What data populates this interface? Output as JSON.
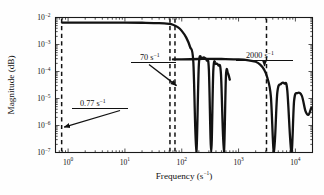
{
  "chart_data": {
    "type": "line",
    "title": "",
    "xlabel": "Frequency (s−1)",
    "xlabel_text": "Frequency (s",
    "xlabel_sup": "−1",
    "xlabel_tail": ")",
    "ylabel": "Magnitude (dB)",
    "xscale": "log",
    "yscale": "log",
    "xlim": [
      0.6,
      20000
    ],
    "ylim": [
      1e-07,
      0.01
    ],
    "grid": false,
    "legend": "none",
    "xticks": [
      {
        "value": 1,
        "label": "10",
        "sup": "0"
      },
      {
        "value": 10,
        "label": "10",
        "sup": "1"
      },
      {
        "value": 100,
        "label": "10",
        "sup": "2"
      },
      {
        "value": 1000,
        "label": "10",
        "sup": "3"
      },
      {
        "value": 10000,
        "label": "10",
        "sup": "4"
      }
    ],
    "yticks": [
      {
        "value": 0.01,
        "label": "10",
        "sup": "−2"
      },
      {
        "value": 0.001,
        "label": "10",
        "sup": "−3"
      },
      {
        "value": 0.0001,
        "label": "10",
        "sup": "−4"
      },
      {
        "value": 1e-05,
        "label": "10",
        "sup": "−5"
      },
      {
        "value": 1e-06,
        "label": "10",
        "sup": "−6"
      },
      {
        "value": 1e-07,
        "label": "10",
        "sup": "−7"
      }
    ],
    "series": [
      {
        "name": "low-frequency-branch",
        "style": "solid",
        "plateau": 0.0065,
        "corner": 70,
        "nulls": [
          180,
          330,
          550
        ],
        "points": [
          [
            0.78,
            0.0065
          ],
          [
            1.0,
            0.0065
          ],
          [
            2.0,
            0.0065
          ],
          [
            5.0,
            0.0065
          ],
          [
            10,
            0.0065
          ],
          [
            20,
            0.0064
          ],
          [
            40,
            0.0062
          ],
          [
            60,
            0.0058
          ],
          [
            70,
            0.0054
          ],
          [
            85,
            0.0044
          ],
          [
            100,
            0.0032
          ],
          [
            120,
            0.0018
          ],
          [
            140,
            0.00082
          ],
          [
            160,
            0.00022
          ],
          [
            180,
            1e-07
          ],
          [
            200,
            0.00018
          ],
          [
            225,
            0.0003
          ],
          [
            250,
            0.00033
          ],
          [
            275,
            0.00026
          ],
          [
            300,
            0.00012
          ],
          [
            330,
            1e-07
          ],
          [
            360,
            0.00012
          ],
          [
            400,
            0.00019
          ],
          [
            440,
            0.00017
          ],
          [
            490,
            8e-05
          ],
          [
            550,
            1e-07
          ],
          [
            600,
            7e-05
          ],
          [
            650,
            8.5e-05
          ],
          [
            700,
            5e-05
          ]
        ]
      },
      {
        "name": "high-frequency-branch",
        "style": "solid",
        "plateau": 0.00028,
        "corner": 2000,
        "nulls": [
          4200,
          8500
        ],
        "points": [
          [
            70,
            0.00028
          ],
          [
            100,
            0.00028
          ],
          [
            200,
            0.00029
          ],
          [
            300,
            0.000295
          ],
          [
            500,
            0.00029
          ],
          [
            1000,
            0.00028
          ],
          [
            1500,
            0.00026
          ],
          [
            2000,
            0.00023
          ],
          [
            2400,
            0.00018
          ],
          [
            2800,
            0.00012
          ],
          [
            3200,
            6e-05
          ],
          [
            3700,
            1.2e-05
          ],
          [
            4200,
            1e-07
          ],
          [
            4800,
            1.6e-05
          ],
          [
            5600,
            3.5e-05
          ],
          [
            6400,
            3.6e-05
          ],
          [
            7200,
            2e-05
          ],
          [
            8500,
            1e-07
          ],
          [
            9500,
            8.5e-06
          ],
          [
            11000,
            1.6e-05
          ],
          [
            13000,
            1.25e-05
          ],
          [
            15000,
            3.5e-06
          ],
          [
            17000,
            2.5e-06
          ],
          [
            19000,
            4.5e-06
          ]
        ]
      }
    ],
    "markers": [
      {
        "name": "marker-077",
        "value": 0.77,
        "label": "0.77 s",
        "sup": "−1",
        "style": "dashed"
      },
      {
        "name": "marker-70-a",
        "value": 62,
        "label": "",
        "sup": "",
        "style": "dashed"
      },
      {
        "name": "marker-70-b",
        "value": 76,
        "label": "70 s",
        "sup": "−1",
        "style": "dashed"
      },
      {
        "name": "marker-2000",
        "value": 3100,
        "label": "2000 s",
        "sup": "−1",
        "style": "dashed"
      }
    ],
    "annotations": [
      {
        "name": "annotation-077",
        "text": "0.77 s",
        "sup": "−1",
        "arrow_to": [
          0.77,
          8e-07
        ]
      },
      {
        "name": "annotation-70",
        "text": "70 s",
        "sup": "−1",
        "arrow_to": [
          70,
          3e-05
        ]
      },
      {
        "name": "annotation-2000",
        "text": "2000 s",
        "sup": "−1",
        "arrow_to": [
          2400,
          0.00016
        ]
      }
    ]
  }
}
